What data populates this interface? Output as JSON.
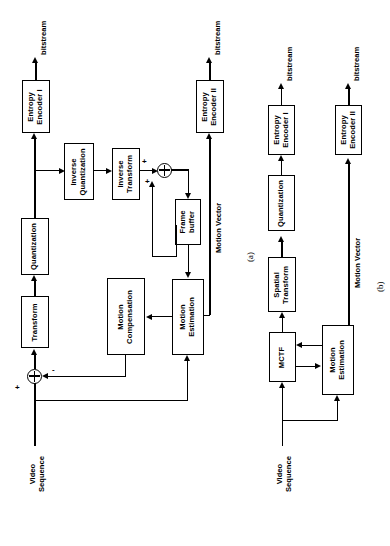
{
  "figure": {
    "panels": [
      {
        "id": "a",
        "caption": "(a)",
        "blocks": [
          {
            "name": "transform",
            "label": "Transform"
          },
          {
            "name": "quantization",
            "label": "Quantization"
          },
          {
            "name": "entropy-encoder-1",
            "label": "Entropy\nEncoder I"
          },
          {
            "name": "inverse-quantization",
            "label": "Inverse\nQuantization"
          },
          {
            "name": "inverse-transform",
            "label": "Inverse\nTransform"
          },
          {
            "name": "frame-buffer",
            "label": "Frame\nbuffer"
          },
          {
            "name": "motion-compensation",
            "label": "Motion\nCompensation"
          },
          {
            "name": "motion-estimation",
            "label": "Motion\nEstimation"
          },
          {
            "name": "entropy-encoder-2",
            "label": "Entropy\nEncoder II"
          }
        ],
        "labels": {
          "input": "Video\nSequence",
          "bitstream_1": "bitstream",
          "bitstream_2": "bitstream",
          "motion_vector": "Motion Vector",
          "sign_plus": "+",
          "sign_minus": "-",
          "sign_plus_2": "+",
          "sign_plus_3": "+"
        }
      },
      {
        "id": "b",
        "caption": "(b)",
        "blocks": [
          {
            "name": "mctf",
            "label": "MCTF"
          },
          {
            "name": "spatial-transform",
            "label": "Spatial\nTransform"
          },
          {
            "name": "quantization",
            "label": "Quantization"
          },
          {
            "name": "entropy-encoder-1",
            "label": "Entropy\nEncoder I"
          },
          {
            "name": "motion-estimation",
            "label": "Motion\nEstimation"
          },
          {
            "name": "entropy-encoder-2",
            "label": "Entropy\nEncoder II"
          }
        ],
        "labels": {
          "input": "Video\nSequence",
          "bitstream_1": "bitstream",
          "bitstream_2": "bitstream",
          "motion_vector": "Motion Vector"
        }
      }
    ],
    "colors": {
      "stroke": "#000000",
      "background": "#ffffff"
    }
  }
}
